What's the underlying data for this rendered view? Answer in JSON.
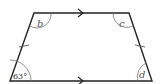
{
  "diagram": {
    "shape": "isosceles trapezium",
    "angles": {
      "bottom_left": "63°",
      "top_left": "b",
      "top_right": "c",
      "bottom_right": "d"
    },
    "markings": {
      "parallel_arrows": [
        "top",
        "bottom"
      ],
      "equal_ticks": [
        "left",
        "right"
      ]
    }
  }
}
